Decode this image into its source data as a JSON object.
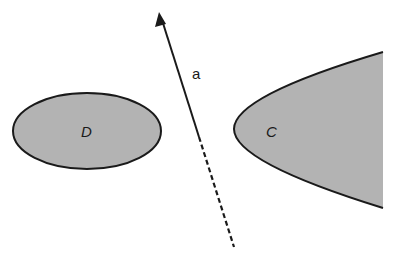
{
  "diagram": {
    "type": "geometric-separation",
    "colors": {
      "background": "#ffffff",
      "fill": "#b3b3b3",
      "stroke": "#1a1a1a"
    },
    "shapes": [
      {
        "id": "D",
        "label": "D",
        "kind": "ellipse",
        "label_style": "italic"
      },
      {
        "id": "C",
        "label": "C",
        "kind": "parabola-region",
        "label_style": "italic"
      }
    ],
    "vector": {
      "label": "a",
      "solid_segment": "arrow pointing up-left",
      "dashed_segment": "extension downward"
    }
  }
}
